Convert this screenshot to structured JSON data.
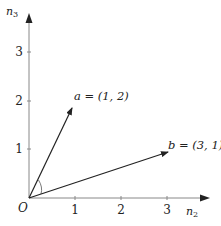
{
  "diagram": {
    "origin_label": "O",
    "x_axis": {
      "label": "n",
      "label_sub": "2",
      "ticks": [
        "1",
        "2",
        "3"
      ]
    },
    "y_axis": {
      "label": "n",
      "label_sub": "3",
      "ticks": [
        "1",
        "2",
        "3"
      ]
    },
    "vectors": [
      {
        "name": "a",
        "label": "a = (1, 2)",
        "coords": [
          1,
          2
        ]
      },
      {
        "name": "b",
        "label": "b = (3, 1)",
        "coords": [
          3,
          1
        ]
      }
    ],
    "angle_marker": true,
    "colors": {
      "axis": "#888888",
      "vector": "#222222",
      "text": "#222222"
    }
  }
}
